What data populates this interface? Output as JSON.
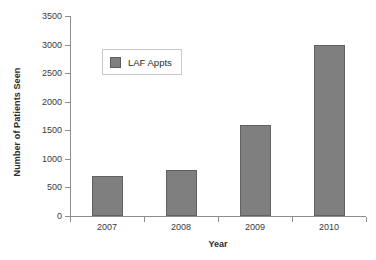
{
  "chart_data": {
    "type": "bar",
    "title": "",
    "xlabel": "Year",
    "ylabel": "Number of Patients Seen",
    "categories": [
      "2007",
      "2008",
      "2009",
      "2010"
    ],
    "series": [
      {
        "name": "LAF Appts",
        "values": [
          700,
          800,
          1600,
          3000
        ],
        "color": "#7f7f7f"
      }
    ],
    "ylim": [
      0,
      3500
    ],
    "yticks": [
      0,
      500,
      1000,
      1500,
      2000,
      2500,
      3000,
      3500
    ],
    "ytick_labels": [
      "0",
      "500",
      "1000",
      "1500",
      "2000",
      "2500",
      "3000",
      "3500"
    ],
    "grid": false,
    "legend": {
      "entries": [
        "LAF Appts"
      ],
      "position": "upper-left-inside"
    },
    "axis_color": "#8d8d8d",
    "background": "#ffffff"
  }
}
